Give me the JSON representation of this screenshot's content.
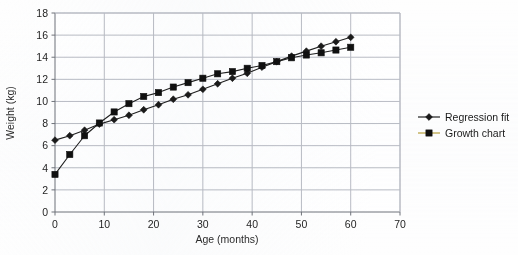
{
  "chart_data": {
    "type": "line",
    "title": "",
    "xlabel": "Age (months)",
    "ylabel": "Weight (kg)",
    "xlim": [
      0,
      70
    ],
    "ylim": [
      0,
      18
    ],
    "xticks": [
      0,
      10,
      20,
      30,
      40,
      50,
      60,
      70
    ],
    "yticks": [
      0,
      2,
      4,
      6,
      8,
      10,
      12,
      14,
      16,
      18
    ],
    "grid": true,
    "legend_position": "right-outside",
    "series": [
      {
        "name": "Regression fit",
        "marker": "diamond",
        "color": "#1a1a1a",
        "line_color": "#1f1f1f",
        "points": [
          {
            "x": 0,
            "y": 6.5
          },
          {
            "x": 3,
            "y": 6.9
          },
          {
            "x": 6,
            "y": 7.4
          },
          {
            "x": 9,
            "y": 7.95
          },
          {
            "x": 12,
            "y": 8.35
          },
          {
            "x": 15,
            "y": 8.75
          },
          {
            "x": 18,
            "y": 9.25
          },
          {
            "x": 21,
            "y": 9.7
          },
          {
            "x": 24,
            "y": 10.2
          },
          {
            "x": 27,
            "y": 10.6
          },
          {
            "x": 30,
            "y": 11.1
          },
          {
            "x": 33,
            "y": 11.6
          },
          {
            "x": 36,
            "y": 12.1
          },
          {
            "x": 39,
            "y": 12.55
          },
          {
            "x": 42,
            "y": 13.1
          },
          {
            "x": 45,
            "y": 13.6
          },
          {
            "x": 48,
            "y": 14.1
          },
          {
            "x": 51,
            "y": 14.55
          },
          {
            "x": 54,
            "y": 15.0
          },
          {
            "x": 57,
            "y": 15.4
          },
          {
            "x": 60,
            "y": 15.8
          }
        ]
      },
      {
        "name": "Growth chart",
        "marker": "square",
        "color": "#101010",
        "line_color": "#1f1f1f",
        "legend_line_color": "#b8a03c",
        "points": [
          {
            "x": 0,
            "y": 3.4
          },
          {
            "x": 3,
            "y": 5.2
          },
          {
            "x": 6,
            "y": 6.9
          },
          {
            "x": 9,
            "y": 8.05
          },
          {
            "x": 12,
            "y": 9.05
          },
          {
            "x": 15,
            "y": 9.8
          },
          {
            "x": 18,
            "y": 10.45
          },
          {
            "x": 21,
            "y": 10.8
          },
          {
            "x": 24,
            "y": 11.3
          },
          {
            "x": 27,
            "y": 11.7
          },
          {
            "x": 30,
            "y": 12.1
          },
          {
            "x": 33,
            "y": 12.5
          },
          {
            "x": 36,
            "y": 12.7
          },
          {
            "x": 39,
            "y": 13.0
          },
          {
            "x": 42,
            "y": 13.25
          },
          {
            "x": 45,
            "y": 13.6
          },
          {
            "x": 48,
            "y": 13.95
          },
          {
            "x": 51,
            "y": 14.2
          },
          {
            "x": 54,
            "y": 14.4
          },
          {
            "x": 57,
            "y": 14.65
          },
          {
            "x": 60,
            "y": 14.9
          }
        ]
      }
    ]
  },
  "legend": {
    "items": [
      {
        "label": "Regression fit",
        "marker": "diamond"
      },
      {
        "label": "Growth chart",
        "marker": "square"
      }
    ]
  },
  "colors": {
    "grid": "#b9bcc4",
    "axis": "#6f737a",
    "background": "#ffffff",
    "series_dark": "#141414",
    "growth_legend_line": "#b8a03c"
  }
}
